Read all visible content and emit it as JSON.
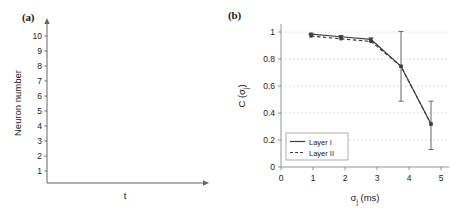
{
  "figure": {
    "panel_a_tag": "(a)",
    "panel_b_tag": "(b)"
  },
  "panel_a": {
    "ylabel": "Neuron number",
    "xlabel": "t",
    "ytick_labels": [
      "1",
      "2",
      "3",
      "4",
      "5",
      "6",
      "7",
      "8",
      "9",
      "10"
    ],
    "spike_color": "#1a1a1a",
    "axis_color": "#555555"
  },
  "panel_b": {
    "ylabel_main": "C (",
    "ylabel_sigma": "σ",
    "ylabel_sub": "j",
    "ylabel_close": ")",
    "xlabel_sigma": "σ",
    "xlabel_sub": "j",
    "xlabel_units": " (ms)",
    "xtick_labels": [
      "0",
      "1",
      "2",
      "3",
      "4",
      "5"
    ],
    "ytick_labels": [
      "0",
      "0.2",
      "0.4",
      "0.6",
      "0.8",
      "1"
    ],
    "legend": [
      {
        "label": "Layer I",
        "style": "solid"
      },
      {
        "label": "Layer II",
        "style": "dashed"
      }
    ],
    "series_color": "#3d3d3d",
    "grid_color": "#c8c8c8"
  },
  "chart_data": [
    {
      "type": "scatter",
      "title": "(a) Spike raster",
      "xlabel": "t",
      "ylabel": "Neuron number",
      "xlim": [
        0,
        10
      ],
      "ylim": [
        0,
        10.8
      ],
      "grid": false,
      "note": "Each marker is a pair of vertical spike ticks (a doublet) for one neuron.",
      "points": [
        {
          "neuron": 10,
          "t": 3.7
        },
        {
          "neuron": 9,
          "t": 5.65
        },
        {
          "neuron": 8,
          "t": 2.6
        },
        {
          "neuron": 7,
          "t": 8.45
        },
        {
          "neuron": 6,
          "t": 8.1
        },
        {
          "neuron": 5,
          "t": 8.95
        },
        {
          "neuron": 4,
          "t": 8.3
        },
        {
          "neuron": 3,
          "t": 4.65
        },
        {
          "neuron": 2,
          "t": 7.15
        },
        {
          "neuron": 1,
          "t": 1.25
        }
      ]
    },
    {
      "type": "line",
      "title": "(b) Correlation vs jitter",
      "xlabel": "σj (ms)",
      "ylabel": "C (σj)",
      "xlim": [
        0,
        5.6
      ],
      "ylim": [
        0,
        1.08
      ],
      "grid": true,
      "legend_position": "lower-left",
      "x": [
        1,
        2,
        3,
        4,
        5
      ],
      "series": [
        {
          "name": "Layer I",
          "style": "solid",
          "values": [
            0.99,
            0.97,
            0.95,
            0.75,
            0.32
          ],
          "yerr_low": [
            0.985,
            0.962,
            0.935,
            0.49,
            0.13
          ],
          "yerr_high": [
            0.995,
            0.978,
            0.962,
            1.01,
            0.49
          ]
        },
        {
          "name": "Layer II",
          "style": "dashed",
          "values": [
            0.975,
            0.955,
            0.935,
            0.75,
            0.32
          ],
          "yerr_low": [
            0.97,
            0.95,
            0.925,
            0.49,
            0.13
          ],
          "yerr_high": [
            0.98,
            0.96,
            0.945,
            1.01,
            0.49
          ]
        }
      ]
    }
  ]
}
